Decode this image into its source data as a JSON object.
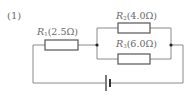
{
  "problem": {
    "number": "(1)"
  },
  "circuit": {
    "resistors": [
      {
        "id": "R1",
        "symbol": "R",
        "subscript": "1",
        "value": "(2.5Ω)",
        "placement": "series"
      },
      {
        "id": "R2",
        "symbol": "R",
        "subscript": "2",
        "value": "(4.0Ω)",
        "placement": "parallel-top"
      },
      {
        "id": "R3",
        "symbol": "R",
        "subscript": "3",
        "value": "(6.0Ω)",
        "placement": "parallel-bottom"
      }
    ],
    "source": {
      "type": "battery"
    },
    "colors": {
      "wire": "#8a8a8a",
      "component": "#555555",
      "junction": "#222222",
      "text": "#6a6a6a"
    }
  }
}
